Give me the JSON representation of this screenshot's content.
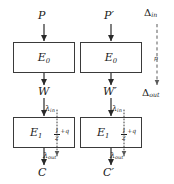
{
  "diagram": {
    "stroke_color": "#3a3a3a",
    "text_color": "#1a1a1a",
    "background": "#ffffff",
    "left_branch": {
      "input_label": "P",
      "stage1_label": "E",
      "stage1_sub": "0",
      "mid_label": "W",
      "lambda_in": "λ",
      "lambda_in_sub": "in",
      "stage2_label": "E",
      "stage2_sub": "1",
      "bias_numerator": "1",
      "bias_denominator": "2",
      "bias_tail": "+q",
      "lambda_out": "λ",
      "lambda_out_sub": "out",
      "output_label": "C"
    },
    "right_branch": {
      "input_label": "P′",
      "stage1_label": "E",
      "stage1_sub": "0",
      "mid_label": "W′",
      "lambda_in": "λ",
      "lambda_in_sub": "in",
      "stage2_label": "E",
      "stage2_sub": "1",
      "bias_numerator": "1",
      "bias_denominator": "2",
      "bias_tail": "+q",
      "lambda_out": "λ",
      "lambda_out_sub": "out",
      "output_label": "C′"
    },
    "delta_channel": {
      "top_label": "Δ",
      "top_sub": "in",
      "bottom_label": "Δ",
      "bottom_sub": "out",
      "edge_label": "p"
    }
  }
}
